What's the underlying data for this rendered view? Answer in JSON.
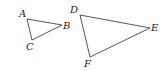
{
  "diagram": {
    "title": "",
    "triangles": [
      {
        "name": "ABC",
        "vertices": [
          {
            "label": "A",
            "x": 27,
            "y": 19,
            "lx": 19,
            "ly": 17
          },
          {
            "label": "B",
            "x": 62,
            "y": 25,
            "lx": 63,
            "ly": 29
          },
          {
            "label": "C",
            "x": 32,
            "y": 40,
            "lx": 26,
            "ly": 50
          }
        ]
      },
      {
        "name": "DEF",
        "vertices": [
          {
            "label": "D",
            "x": 80,
            "y": 15,
            "lx": 70,
            "ly": 13
          },
          {
            "label": "E",
            "x": 150,
            "y": 28,
            "lx": 151,
            "ly": 31
          },
          {
            "label": "F",
            "x": 90,
            "y": 57,
            "lx": 84,
            "ly": 67
          }
        ]
      }
    ]
  }
}
